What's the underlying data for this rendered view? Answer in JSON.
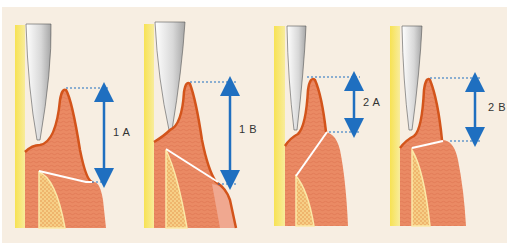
{
  "figure": {
    "background": "#f7eee2",
    "colors": {
      "tooth_root": "#f4e36a",
      "probe_light": "#f2f2f2",
      "probe_dark": "#9a9a9a",
      "gingiva": "#ea8a64",
      "gingiva_outline": "#d3541b",
      "gingiva_pale": "#f0a890",
      "bone": "#f6cf86",
      "bone_rim": "#fbe9a8",
      "arrow": "#1f6fc0",
      "dotted": "#1f6fc0",
      "attachment_line": "#ffffff"
    },
    "panels": [
      {
        "id": "1A",
        "label": "1 A",
        "ox": 8,
        "top_y": 90,
        "bottom_y": 182,
        "arrow_x": 106,
        "label_x": 112,
        "label_y": 132,
        "variant": "A1"
      },
      {
        "id": "1B",
        "label": "1 B",
        "ox": 140,
        "top_y": 82,
        "bottom_y": 184,
        "arrow_x": 232,
        "label_x": 238,
        "label_y": 128,
        "variant": "B1"
      },
      {
        "id": "2A",
        "label": "2 A",
        "ox": 270,
        "top_y": 77,
        "bottom_y": 132,
        "arrow_x": 353,
        "label_x": 361,
        "label_y": 100,
        "variant": "A2"
      },
      {
        "id": "2B",
        "label": "2 B",
        "ox": 388,
        "top_y": 78,
        "bottom_y": 141,
        "arrow_x": 476,
        "label_x": 490,
        "label_y": 104,
        "variant": "B2"
      }
    ]
  }
}
